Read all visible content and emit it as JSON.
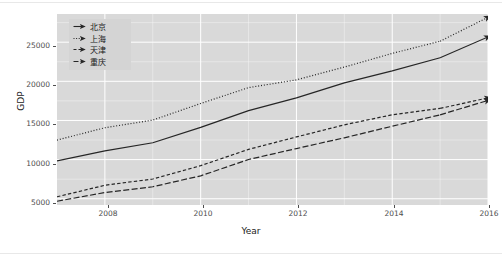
{
  "chart_data": {
    "type": "line",
    "title": "",
    "xlabel": "Year",
    "ylabel": "GDP",
    "xlim": [
      2007,
      2016
    ],
    "ylim": [
      4200,
      28600
    ],
    "grid": true,
    "legend_position": "top-left inside panel",
    "x": [
      2007,
      2008,
      2009,
      2010,
      2011,
      2012,
      2013,
      2014,
      2015,
      2016
    ],
    "xticks": [
      "2008",
      "2010",
      "2012",
      "2014",
      "2016"
    ],
    "xtick_values": [
      2008,
      2010,
      2012,
      2014,
      2016
    ],
    "yticks": [
      "5000",
      "10000",
      "15000",
      "20000",
      "25000"
    ],
    "ytick_values": [
      5000,
      10000,
      15000,
      20000,
      25000
    ],
    "series": [
      {
        "name": "北京",
        "name_en": "Beijing",
        "linetype": "solid",
        "color": "#262626",
        "values": [
          9847,
          11115,
          12153,
          14114,
          16252,
          17879,
          19801,
          21331,
          23015,
          25669
        ]
      },
      {
        "name": "上海",
        "name_en": "Shanghai",
        "linetype": "dotted",
        "color": "#262626",
        "values": [
          12494,
          14070,
          15046,
          17166,
          19196,
          20182,
          21818,
          23568,
          25123,
          28179
        ]
      },
      {
        "name": "天津",
        "name_en": "Tianjin",
        "linetype": "dashed",
        "color": "#262626",
        "values": [
          5252,
          6719,
          7522,
          9224,
          11307,
          12894,
          14442,
          15727,
          16538,
          17885
        ]
      },
      {
        "name": "重庆",
        "name_en": "Chongqing",
        "linetype": "longdash",
        "color": "#262626",
        "values": [
          4676,
          5794,
          6530,
          7926,
          10011,
          11410,
          12783,
          14263,
          15717,
          17559
        ]
      }
    ]
  },
  "axes": {
    "y_title": "GDP",
    "x_title": "Year",
    "y_tick_labels": [
      "25000",
      "20000",
      "15000",
      "10000",
      "5000"
    ],
    "x_tick_labels": [
      "2008",
      "2010",
      "2012",
      "2014",
      "2016"
    ]
  },
  "legend": {
    "items": [
      {
        "label": "北京",
        "key": "line-key-solid"
      },
      {
        "label": "上海",
        "key": "line-key-dotted"
      },
      {
        "label": "天津",
        "key": "line-key-dashed"
      },
      {
        "label": "重庆",
        "key": "line-key-longdash"
      }
    ]
  },
  "theme": {
    "panel_background": "#d9d9d9",
    "grid_color": "#ffffff",
    "line_color": "#262626",
    "text_color": "#4d4d4d",
    "page_background": "#ffffff"
  }
}
